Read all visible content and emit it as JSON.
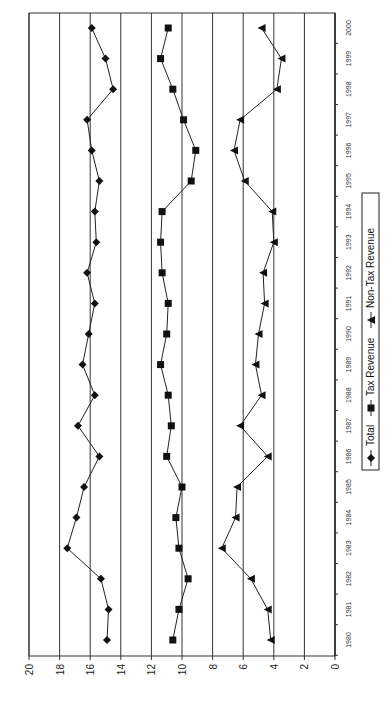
{
  "chart_data": {
    "type": "line",
    "orientation": "rotated-90-ccw",
    "title": "",
    "xlabel": "",
    "ylabel": "",
    "x": [
      1980,
      1981,
      1982,
      1983,
      1984,
      1985,
      1986,
      1987,
      1988,
      1989,
      1990,
      1991,
      1992,
      1993,
      1994,
      1995,
      1996,
      1997,
      1998,
      1999,
      2000
    ],
    "x_tick_labels": [
      "1980",
      "1981",
      "1982",
      "1983",
      "1984",
      "1985",
      "1986",
      "1987",
      "1988",
      "1989",
      "1990",
      "1991",
      "1992",
      "1993",
      "1994",
      "1995",
      "1996",
      "1997",
      "1998",
      "1999",
      "2000"
    ],
    "ylim": [
      0,
      20
    ],
    "y_ticks": [
      0,
      2,
      4,
      6,
      8,
      10,
      12,
      14,
      16,
      18,
      20
    ],
    "y_tick_labels": [
      "0",
      "2",
      "4",
      "6",
      "8",
      "10",
      "12",
      "14",
      "16",
      "18",
      "20"
    ],
    "grid": true,
    "legend_position": "bottom",
    "series": [
      {
        "name": "Total",
        "marker": "diamond",
        "values": [
          14.9,
          14.8,
          15.3,
          17.5,
          16.9,
          16.4,
          15.4,
          16.8,
          15.7,
          16.5,
          16.1,
          15.7,
          16.2,
          15.6,
          15.7,
          15.4,
          15.9,
          16.2,
          14.5,
          15.0,
          15.9
        ]
      },
      {
        "name": "Tax Revenue",
        "marker": "square",
        "values": [
          10.6,
          10.2,
          9.6,
          10.2,
          10.4,
          10.0,
          11.0,
          10.7,
          10.9,
          11.4,
          11.0,
          10.9,
          11.3,
          11.4,
          11.3,
          9.4,
          9.1,
          9.9,
          10.6,
          11.4,
          10.9
        ]
      },
      {
        "name": "Non-Tax Revenue",
        "marker": "triangle",
        "values": [
          4.2,
          4.4,
          5.5,
          7.4,
          6.5,
          6.4,
          4.4,
          6.2,
          4.8,
          5.2,
          5.0,
          4.6,
          4.7,
          4.0,
          4.1,
          5.9,
          6.6,
          6.2,
          3.8,
          3.5,
          4.8
        ]
      }
    ]
  },
  "legend": {
    "items": [
      {
        "label": "Total",
        "marker": "diamond"
      },
      {
        "label": "Tax Revenue",
        "marker": "square"
      },
      {
        "label": "Non-Tax Revenue",
        "marker": "triangle"
      }
    ]
  }
}
